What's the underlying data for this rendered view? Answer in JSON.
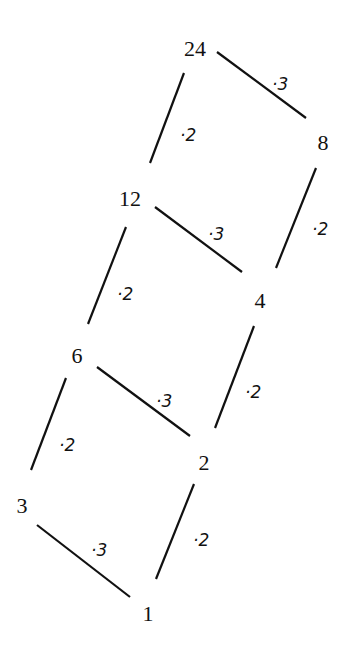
{
  "nodes": [
    {
      "id": "n24",
      "label": "24"
    },
    {
      "id": "n8",
      "label": "8"
    },
    {
      "id": "n12",
      "label": "12"
    },
    {
      "id": "n4",
      "label": "4"
    },
    {
      "id": "n6",
      "label": "6"
    },
    {
      "id": "n2",
      "label": "2"
    },
    {
      "id": "n3",
      "label": "3"
    },
    {
      "id": "n1",
      "label": "1"
    }
  ],
  "edges": [
    {
      "from": "24",
      "to": "8",
      "label": "·3"
    },
    {
      "from": "24",
      "to": "12",
      "label": "·2"
    },
    {
      "from": "8",
      "to": "4",
      "label": "·2"
    },
    {
      "from": "12",
      "to": "4",
      "label": "·3"
    },
    {
      "from": "12",
      "to": "6",
      "label": "·2"
    },
    {
      "from": "4",
      "to": "2",
      "label": "·2"
    },
    {
      "from": "6",
      "to": "2",
      "label": "·3"
    },
    {
      "from": "6",
      "to": "3",
      "label": "·2"
    },
    {
      "from": "2",
      "to": "1",
      "label": "·2"
    },
    {
      "from": "3",
      "to": "1",
      "label": "·3"
    }
  ],
  "colors": {
    "ink": "#111111",
    "background": "#ffffff"
  }
}
